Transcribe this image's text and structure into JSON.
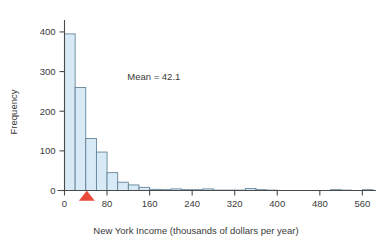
{
  "chart_data": {
    "type": "bar",
    "title": "",
    "subtitle": "",
    "xlabel": "New York Income (thousands of dollars per year)",
    "ylabel": "Frequency",
    "xlim": [
      0,
      580
    ],
    "ylim": [
      0,
      420
    ],
    "grid": false,
    "legend": null,
    "bin_width": 20,
    "x_ticks": [
      0,
      80,
      160,
      240,
      320,
      400,
      480,
      560
    ],
    "x_tick_labels": [
      "0",
      "80",
      "160",
      "240",
      "320",
      "400",
      "480",
      "560"
    ],
    "y_ticks": [
      0,
      100,
      200,
      300,
      400
    ],
    "y_tick_labels": [
      "0",
      "100",
      "200",
      "300",
      "400"
    ],
    "bin_starts": [
      0,
      20,
      40,
      60,
      80,
      100,
      120,
      140,
      160,
      180,
      200,
      220,
      240,
      260,
      280,
      300,
      320,
      340,
      360,
      380,
      400,
      420,
      440,
      460,
      480,
      500,
      520,
      540,
      560
    ],
    "values": [
      395,
      260,
      131,
      97,
      45,
      21,
      14,
      8,
      3,
      2,
      4,
      2,
      2,
      4,
      1,
      1,
      1,
      5,
      2,
      1,
      0,
      0,
      0,
      0,
      0,
      2,
      1,
      0,
      2
    ],
    "annotations": [
      {
        "name": "mean-label",
        "text": "Mean = 42.1",
        "x": 118,
        "y": 278
      },
      {
        "name": "mean-marker",
        "text": "",
        "x": 42,
        "y": 0,
        "shape": "triangle-up",
        "color": "#e8493a"
      }
    ],
    "mean": 42.1,
    "colors": {
      "bar_fill": "#d8eaf5",
      "bar_stroke": "#5d7f96",
      "axis": "#4a4a4a",
      "text": "#3a3a3a",
      "marker": "#e8493a"
    }
  }
}
